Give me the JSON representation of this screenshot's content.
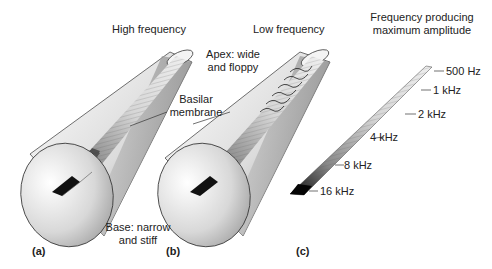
{
  "figure": {
    "panels": [
      {
        "id": "a",
        "label": "(a)",
        "title": "High frequency"
      },
      {
        "id": "b",
        "label": "(b)",
        "title": "Low frequency"
      },
      {
        "id": "c",
        "label": "(c)",
        "title_line1": "Frequency producing",
        "title_line2": "maximum amplitude"
      }
    ],
    "annotations": {
      "basilar_line1": "Basilar",
      "basilar_line2": "membrane",
      "apex_line1": "Apex: wide",
      "apex_line2": "and floppy",
      "base_line1": "Base: narrow",
      "base_line2": "and stiff"
    },
    "frequency_scale": [
      "500 Hz",
      "1 kHz",
      "2 kHz",
      "4 kHz",
      "8 kHz",
      "16 kHz"
    ],
    "colors": {
      "outline": "#333333",
      "membrane_dark": "#111111",
      "membrane_light": "#e0e0e0",
      "tube_light": "#f4f4f4",
      "tube_dark": "#9a9a9a"
    }
  }
}
